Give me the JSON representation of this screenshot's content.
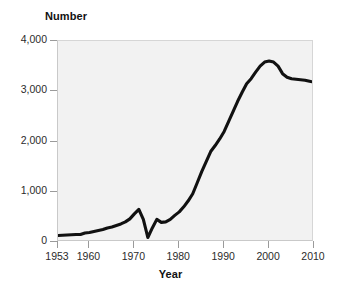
{
  "chart_data": {
    "type": "line",
    "title": "",
    "xlabel": "Year",
    "ylabel": "Number",
    "xlim": [
      1953,
      2010
    ],
    "ylim": [
      0,
      4000
    ],
    "grid": false,
    "legend": null,
    "xticks": [
      1953,
      1960,
      1970,
      1980,
      1990,
      2000,
      2010
    ],
    "xtick_labels": [
      "1953",
      "1960",
      "1970",
      "1980",
      "1990",
      "2000",
      "2010"
    ],
    "yticks": [
      0,
      1000,
      2000,
      3000,
      4000
    ],
    "ytick_labels": [
      "0",
      "1,000",
      "2,000",
      "3,000",
      "4,000"
    ],
    "series": [
      {
        "name": "Number",
        "color": "#111111",
        "x": [
          1953,
          1954,
          1955,
          1956,
          1957,
          1958,
          1959,
          1960,
          1961,
          1962,
          1963,
          1964,
          1965,
          1966,
          1967,
          1968,
          1969,
          1970,
          1971,
          1972,
          1973,
          1974,
          1975,
          1976,
          1977,
          1978,
          1979,
          1980,
          1981,
          1982,
          1983,
          1984,
          1985,
          1986,
          1987,
          1988,
          1989,
          1990,
          1991,
          1992,
          1993,
          1994,
          1995,
          1996,
          1997,
          1998,
          1999,
          2000,
          2001,
          2002,
          2003,
          2004,
          2005,
          2006,
          2007,
          2008,
          2009,
          2010
        ],
        "values": [
          130,
          135,
          140,
          145,
          150,
          150,
          180,
          190,
          210,
          230,
          250,
          280,
          300,
          330,
          360,
          400,
          460,
          560,
          650,
          450,
          90,
          280,
          450,
          390,
          400,
          450,
          530,
          600,
          700,
          820,
          960,
          1180,
          1400,
          1600,
          1800,
          1920,
          2050,
          2200,
          2400,
          2600,
          2800,
          2980,
          3150,
          3250,
          3380,
          3500,
          3580,
          3600,
          3580,
          3500,
          3350,
          3280,
          3250,
          3240,
          3230,
          3220,
          3200,
          3180
        ]
      }
    ]
  },
  "axes": {
    "y_title": "Number",
    "x_title": "Year"
  }
}
